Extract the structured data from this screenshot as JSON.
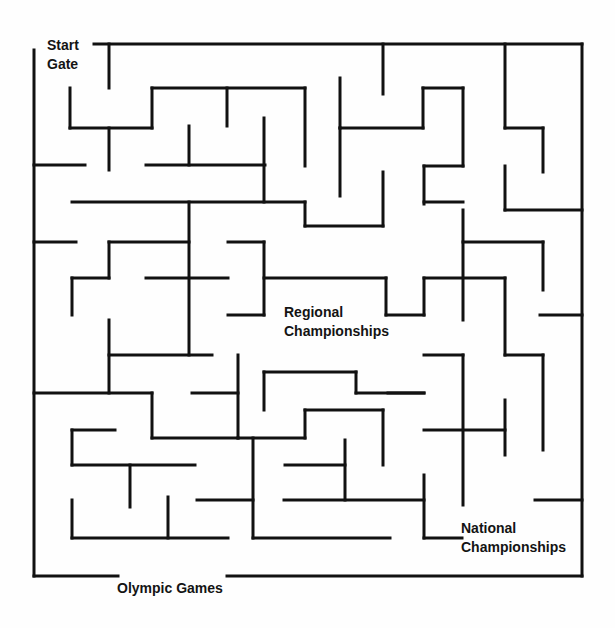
{
  "labels": {
    "start": "Start\nGate",
    "regional": "Regional\nChampionships",
    "national": "National\nChampionships",
    "olympic": "Olympic Games"
  },
  "colors": {
    "wall": "#111111",
    "background": "#fefefe",
    "text": "#141414"
  },
  "walls": [
    [
      94,
      44,
      582,
      44
    ],
    [
      582,
      44,
      582,
      576
    ],
    [
      34,
      576,
      118,
      576
    ],
    [
      227,
      576,
      582,
      576
    ],
    [
      34,
      50,
      34,
      576
    ],
    [
      109,
      44,
      109,
      88
    ],
    [
      383,
      44,
      383,
      94
    ],
    [
      505,
      44,
      505,
      128
    ],
    [
      70,
      88,
      70,
      128
    ],
    [
      70,
      128,
      152,
      128
    ],
    [
      152,
      88,
      152,
      128
    ],
    [
      152,
      88,
      305,
      88
    ],
    [
      227,
      88,
      227,
      126
    ],
    [
      305,
      88,
      305,
      166
    ],
    [
      340,
      78,
      340,
      128
    ],
    [
      340,
      128,
      423,
      128
    ],
    [
      423,
      88,
      423,
      128
    ],
    [
      423,
      88,
      463,
      88
    ],
    [
      463,
      88,
      463,
      166
    ],
    [
      505,
      128,
      543,
      128
    ],
    [
      543,
      128,
      543,
      172
    ],
    [
      505,
      166,
      505,
      210
    ],
    [
      505,
      210,
      582,
      210
    ],
    [
      34,
      165,
      85,
      165
    ],
    [
      109,
      128,
      109,
      170
    ],
    [
      146,
      165,
      265,
      165
    ],
    [
      189,
      126,
      189,
      165
    ],
    [
      264,
      118,
      264,
      202
    ],
    [
      340,
      128,
      340,
      196
    ],
    [
      72,
      202,
      305,
      202
    ],
    [
      189,
      202,
      189,
      355
    ],
    [
      305,
      202,
      305,
      226
    ],
    [
      305,
      226,
      383,
      226
    ],
    [
      383,
      172,
      383,
      226
    ],
    [
      424,
      166,
      463,
      166
    ],
    [
      424,
      166,
      424,
      204
    ],
    [
      424,
      202,
      463,
      202
    ],
    [
      463,
      210,
      463,
      320
    ],
    [
      463,
      242,
      543,
      242
    ],
    [
      543,
      242,
      543,
      290
    ],
    [
      34,
      242,
      76,
      242
    ],
    [
      109,
      242,
      189,
      242
    ],
    [
      109,
      242,
      109,
      278
    ],
    [
      72,
      278,
      109,
      278
    ],
    [
      72,
      278,
      72,
      315
    ],
    [
      146,
      278,
      228,
      278
    ],
    [
      228,
      242,
      264,
      242
    ],
    [
      264,
      242,
      264,
      315
    ],
    [
      228,
      315,
      264,
      315
    ],
    [
      264,
      278,
      386,
      278
    ],
    [
      386,
      278,
      386,
      315
    ],
    [
      386,
      315,
      424,
      315
    ],
    [
      424,
      278,
      424,
      315
    ],
    [
      424,
      278,
      505,
      278
    ],
    [
      505,
      278,
      505,
      355
    ],
    [
      505,
      355,
      543,
      355
    ],
    [
      543,
      355,
      543,
      450
    ],
    [
      540,
      315,
      582,
      315
    ],
    [
      109,
      320,
      109,
      393
    ],
    [
      109,
      355,
      212,
      355
    ],
    [
      34,
      393,
      152,
      393
    ],
    [
      152,
      393,
      152,
      438
    ],
    [
      152,
      438,
      238,
      438
    ],
    [
      238,
      355,
      238,
      438
    ],
    [
      192,
      393,
      238,
      393
    ],
    [
      238,
      438,
      305,
      438
    ],
    [
      305,
      410,
      305,
      438
    ],
    [
      305,
      410,
      383,
      410
    ],
    [
      383,
      410,
      383,
      465
    ],
    [
      264,
      372,
      264,
      410
    ],
    [
      264,
      372,
      356,
      372
    ],
    [
      356,
      372,
      356,
      393
    ],
    [
      356,
      393,
      424,
      393
    ],
    [
      388,
      393,
      424,
      393
    ],
    [
      424,
      355,
      463,
      355
    ],
    [
      463,
      355,
      463,
      505
    ],
    [
      424,
      430,
      505,
      430
    ],
    [
      505,
      400,
      505,
      455
    ],
    [
      72,
      430,
      115,
      430
    ],
    [
      72,
      430,
      72,
      465
    ],
    [
      72,
      465,
      195,
      465
    ],
    [
      130,
      465,
      130,
      507
    ],
    [
      72,
      500,
      72,
      538
    ],
    [
      72,
      538,
      228,
      538
    ],
    [
      168,
      497,
      168,
      538
    ],
    [
      197,
      500,
      253,
      500
    ],
    [
      253,
      438,
      253,
      538
    ],
    [
      253,
      538,
      390,
      538
    ],
    [
      285,
      465,
      345,
      465
    ],
    [
      345,
      440,
      345,
      500
    ],
    [
      284,
      500,
      424,
      500
    ],
    [
      424,
      475,
      424,
      538
    ],
    [
      424,
      538,
      462,
      538
    ],
    [
      535,
      500,
      582,
      500
    ]
  ]
}
